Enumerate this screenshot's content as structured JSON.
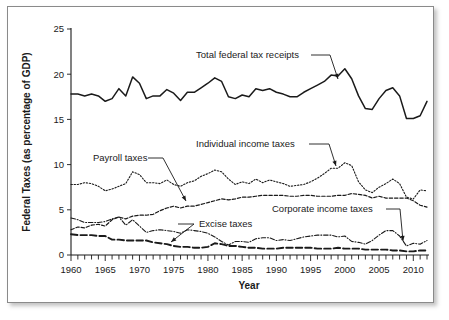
{
  "chart_data": {
    "type": "line",
    "title": "",
    "xlabel": "Year",
    "ylabel": "Federal Taxes (as percentage of GDP)",
    "xlim": [
      1960,
      2012
    ],
    "ylim": [
      0,
      25
    ],
    "ytick_labels": [
      "0",
      "5",
      "10",
      "15",
      "20",
      "25"
    ],
    "ytick_values": [
      0,
      5,
      10,
      15,
      20,
      25
    ],
    "xtick_labels": [
      "1960",
      "1965",
      "1970",
      "1975",
      "1980",
      "1985",
      "1990",
      "1995",
      "2000",
      "2005",
      "2010"
    ],
    "xtick_values": [
      1960,
      1965,
      1970,
      1975,
      1980,
      1985,
      1990,
      1995,
      2000,
      2005,
      2010
    ],
    "minor_xtick_interval": 1,
    "grid": false,
    "legend": "inline-annotations",
    "x": [
      1960,
      1961,
      1962,
      1963,
      1964,
      1965,
      1966,
      1967,
      1968,
      1969,
      1970,
      1971,
      1972,
      1973,
      1974,
      1975,
      1976,
      1977,
      1978,
      1979,
      1980,
      1981,
      1982,
      1983,
      1984,
      1985,
      1986,
      1987,
      1988,
      1989,
      1990,
      1991,
      1992,
      1993,
      1994,
      1995,
      1996,
      1997,
      1998,
      1999,
      2000,
      2001,
      2002,
      2003,
      2004,
      2005,
      2006,
      2007,
      2008,
      2009,
      2010,
      2011,
      2012
    ],
    "series": [
      {
        "name": "Total federal tax receipts",
        "line_style": "solid",
        "color": "#1a1a1a",
        "values": [
          17.8,
          17.8,
          17.6,
          17.8,
          17.6,
          17.0,
          17.3,
          18.4,
          17.6,
          19.7,
          19.0,
          17.3,
          17.6,
          17.6,
          18.3,
          17.9,
          17.1,
          18.0,
          18.0,
          18.5,
          19.0,
          19.6,
          19.2,
          17.5,
          17.3,
          17.7,
          17.5,
          18.4,
          18.2,
          18.4,
          18.0,
          17.8,
          17.5,
          17.5,
          18.0,
          18.4,
          18.8,
          19.2,
          19.9,
          19.8,
          20.6,
          19.5,
          17.6,
          16.2,
          16.1,
          17.3,
          18.2,
          18.5,
          17.6,
          15.1,
          15.1,
          15.4,
          17.0
        ]
      },
      {
        "name": "Individual income taxes",
        "line_style": "dotted",
        "color": "#1a1a1a",
        "values": [
          7.8,
          7.8,
          8.0,
          7.9,
          7.6,
          7.1,
          7.3,
          7.6,
          7.9,
          9.2,
          8.9,
          8.0,
          8.0,
          7.9,
          8.3,
          7.8,
          7.6,
          8.0,
          8.2,
          8.7,
          9.0,
          9.4,
          9.2,
          8.4,
          7.8,
          8.1,
          7.9,
          8.4,
          8.0,
          8.3,
          8.1,
          7.9,
          7.6,
          7.7,
          7.8,
          8.1,
          8.5,
          9.0,
          9.6,
          9.6,
          10.2,
          9.9,
          8.1,
          7.2,
          6.9,
          7.5,
          7.9,
          8.4,
          7.9,
          6.4,
          6.2,
          7.2,
          7.1
        ]
      },
      {
        "name": "Payroll taxes",
        "line_style": "dashed",
        "color": "#1a1a1a",
        "values": [
          2.8,
          3.1,
          3.0,
          3.3,
          3.4,
          3.2,
          3.9,
          4.2,
          4.0,
          4.3,
          4.4,
          4.4,
          4.5,
          4.9,
          5.2,
          5.4,
          5.2,
          5.4,
          5.4,
          5.6,
          5.8,
          6.0,
          6.2,
          6.1,
          6.2,
          6.4,
          6.4,
          6.5,
          6.6,
          6.6,
          6.6,
          6.6,
          6.5,
          6.5,
          6.6,
          6.6,
          6.5,
          6.5,
          6.5,
          6.6,
          6.6,
          6.8,
          6.7,
          6.6,
          6.3,
          6.5,
          6.3,
          6.3,
          6.3,
          6.3,
          6.0,
          5.5,
          5.3
        ]
      },
      {
        "name": "Corporate income taxes",
        "line_style": "dash-dot",
        "color": "#1a1a1a",
        "values": [
          4.1,
          3.9,
          3.6,
          3.6,
          3.6,
          3.7,
          4.0,
          4.2,
          3.3,
          3.9,
          3.2,
          2.5,
          2.7,
          2.8,
          2.7,
          2.6,
          2.4,
          2.8,
          2.7,
          2.6,
          2.4,
          2.0,
          1.5,
          1.1,
          1.5,
          1.5,
          1.4,
          1.8,
          1.9,
          1.9,
          1.6,
          1.7,
          1.6,
          1.8,
          2.0,
          2.1,
          2.2,
          2.2,
          2.2,
          2.0,
          2.1,
          1.5,
          1.4,
          1.2,
          1.6,
          2.2,
          2.7,
          2.7,
          2.1,
          1.0,
          1.3,
          1.2,
          1.6
        ]
      },
      {
        "name": "Excise taxes",
        "line_style": "long-dash",
        "color": "#1a1a1a",
        "values": [
          2.3,
          2.2,
          2.2,
          2.2,
          2.1,
          2.1,
          1.7,
          1.7,
          1.6,
          1.6,
          1.6,
          1.6,
          1.4,
          1.3,
          1.2,
          1.0,
          0.9,
          0.9,
          0.8,
          0.8,
          0.9,
          1.3,
          1.2,
          1.0,
          1.0,
          0.9,
          0.8,
          0.8,
          0.7,
          0.7,
          0.7,
          0.8,
          0.8,
          0.8,
          0.8,
          0.8,
          0.7,
          0.7,
          0.7,
          0.8,
          0.7,
          0.7,
          0.7,
          0.6,
          0.6,
          0.6,
          0.6,
          0.5,
          0.5,
          0.4,
          0.4,
          0.5,
          0.5
        ]
      }
    ],
    "annotations": [
      {
        "label": "Total federal tax receipts",
        "target_year": 1997,
        "target_value": 19.2
      },
      {
        "label": "Individual income taxes",
        "target_year": 2000,
        "target_value": 10.2
      },
      {
        "label": "Payroll taxes",
        "target_year": 1979,
        "target_value": 5.6
      },
      {
        "label": "Excise taxes",
        "target_year": 1976,
        "target_value": 0.9
      },
      {
        "label": "Corporate income taxes",
        "target_year": 2010,
        "target_value": 1.3
      }
    ]
  }
}
